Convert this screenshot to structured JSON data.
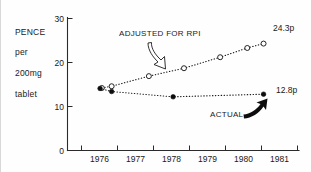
{
  "chart_data": {
    "type": "line",
    "title": "",
    "subtitle": "",
    "xlabel": "",
    "ylabel": "PENCE per 200mg tablet",
    "ylabel_lines": [
      "PENCE",
      "per",
      "200mg",
      "tablet"
    ],
    "xlim": [
      1975.4,
      1981.8
    ],
    "ylim": [
      0,
      30
    ],
    "yticks": [
      0,
      10,
      20,
      30
    ],
    "ytick_labels": [
      "0",
      "10",
      "20",
      "30"
    ],
    "xticks": [
      1975.8,
      1976.8,
      1977.8,
      1978.8,
      1979.8,
      1980.8
    ],
    "xtick_labels": [
      "1976",
      "1977",
      "1978",
      "1979",
      "1980",
      "1981"
    ],
    "xtick_label_positions": [
      1976.3,
      1977.3,
      1978.3,
      1979.3,
      1980.3,
      1981.3
    ],
    "grid": false,
    "legend_position": "annotations-inline",
    "series": [
      {
        "name": "ADJUSTED FOR RPI",
        "marker": "open-circle",
        "linestyle": "dotted",
        "end_label": "24.3p",
        "x": [
          1976.35,
          1976.62,
          1977.65,
          1978.62,
          1979.62,
          1980.37,
          1980.82
        ],
        "y": [
          14.2,
          14.6,
          16.9,
          18.7,
          21.2,
          23.3,
          24.3
        ]
      },
      {
        "name": "ACTUAL",
        "marker": "filled-circle",
        "linestyle": "dotted",
        "end_label": "12.8p",
        "x": [
          1976.3,
          1976.62,
          1978.32,
          1980.82
        ],
        "y": [
          14.1,
          13.4,
          12.2,
          12.8
        ]
      }
    ],
    "annotations": [
      {
        "text": "ADJUSTED FOR RPI",
        "arrow": "hollow-curved-arrow-down-right",
        "points_to_series": "ADJUSTED FOR RPI"
      },
      {
        "text": "ACTUAL",
        "arrow": "solid-curved-arrow-up-right",
        "points_to_series": "ACTUAL"
      }
    ],
    "colors": {
      "ink": "#1a1a1a",
      "marker_fill_open": "#ffffff",
      "marker_fill_solid": "#0d0d0d",
      "background": "#fefefe"
    }
  }
}
